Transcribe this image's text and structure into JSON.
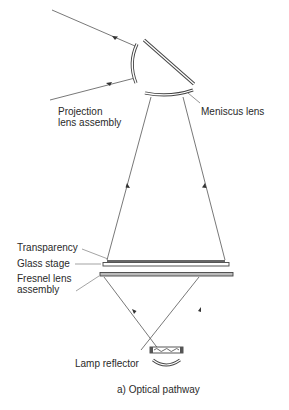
{
  "diagram": {
    "caption": "a) Optical pathway",
    "labels": {
      "projection_lens_line1": "Projection",
      "projection_lens_line2": "lens assembly",
      "meniscus_lens": "Meniscus lens",
      "transparency": "Transparency",
      "glass_stage": "Glass stage",
      "fresnel_line1": "Fresnel lens",
      "fresnel_line2": "assembly",
      "lamp_reflector": "Lamp reflector"
    },
    "components": [
      "projection-lens-assembly",
      "mirror",
      "meniscus-lens",
      "transparency",
      "glass-stage",
      "fresnel-lens-assembly",
      "lamp",
      "lamp-reflector"
    ],
    "colors": {
      "line": "#555555",
      "text": "#2a2a2a",
      "background": "#ffffff"
    }
  }
}
